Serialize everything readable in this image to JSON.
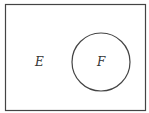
{
  "diagram": {
    "type": "venn",
    "universe": {
      "label": "E",
      "stroke": "#444444"
    },
    "sets": [
      {
        "label": "F",
        "stroke": "#444444"
      }
    ]
  }
}
